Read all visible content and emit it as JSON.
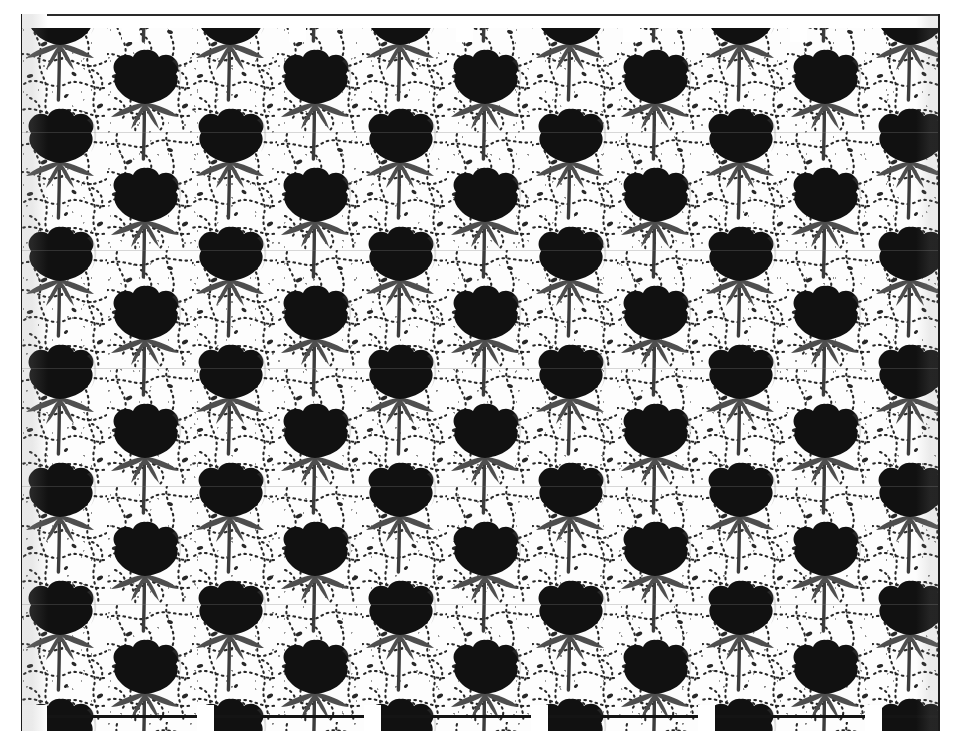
{
  "document": {
    "kind": "scanned-textile-swatch",
    "title": "Floral block-printed fabric pattern",
    "orientation": "landscape",
    "width_px": 961,
    "height_px": 745,
    "page_background": "#ffffff"
  },
  "plate": {
    "left_px": 22,
    "top_px": 14,
    "width_px": 916,
    "height_px": 717,
    "ground_color": "#ffffff",
    "border_rule_color": "#1b1b1b",
    "border_rule_width_px": 2
  },
  "palette": {
    "ink_black": "#0d0d0d",
    "bloom_black": "#111111",
    "calyx_gray": "#4e4e4e",
    "stem_gray": "#3c3c3c",
    "paper_white": "#ffffff",
    "paper_off_white": "#f7f7f7",
    "scroll_dot": "#171717",
    "seam_shadow": "#8c8c8c"
  },
  "motif": {
    "name": "tulip-bloom",
    "description": "solid black lobed bloom above a grey V-shaped calyx on a slender stem",
    "bloom_color": "#111111",
    "calyx_color": "#4e4e4e",
    "stem_color": "#3c3c3c",
    "width_px": 86,
    "height_px": 118
  },
  "repeat": {
    "type": "half-drop",
    "column_pitch_px": 85,
    "row_pitch_px": 118,
    "drop_offset_px": 59,
    "columns": 12,
    "rows": 8,
    "first_column_center_x_px": 38,
    "first_row_center_y_px": 20
  },
  "tiling": {
    "tile_pitch_px": 167,
    "tile_count": 6,
    "top_notch_width_px": 17,
    "top_notch_height_px": 28,
    "bottom_notch_width_px": 40,
    "bottom_notch_height_px": 26,
    "top_notch_x_px": [
      100,
      267,
      434,
      601,
      768
    ],
    "bottom_tile_x_px": [
      25,
      192,
      359,
      526,
      693,
      860
    ],
    "bottom_tile_width_px": 150
  },
  "scan_artifacts": {
    "banding_rows_px": [
      118,
      236,
      354,
      472,
      590
    ],
    "banding_color": "#828282",
    "edge_shadow_color": "#8c8c8c"
  }
}
